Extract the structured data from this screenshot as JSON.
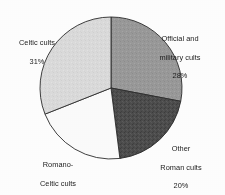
{
  "figure": {
    "background_color": "#ffffff",
    "outline_color": "#2b2b2b"
  },
  "chart_data": {
    "type": "pie",
    "title": "",
    "subtitle": "",
    "xlabel": "",
    "ylabel": "",
    "legend_position": "none",
    "grid": false,
    "start_angle_deg": 0,
    "direction": "clockwise",
    "center": {
      "x": 111,
      "y": 88
    },
    "radius": 71,
    "categories": [
      "Official and military cults",
      "Other Roman cults",
      "Romano-Celtic cults",
      "Celtic cults"
    ],
    "values": [
      28,
      20,
      21,
      31
    ],
    "value_suffix": "%",
    "colors": [
      "#9a9a9a",
      "#4d4d4d",
      "#fcfcfc",
      "#dcdcdc"
    ],
    "slices": [
      {
        "label": "Official and military cults",
        "label_line1": "Official and",
        "label_line2": "military cults",
        "value": 28,
        "value_text": "28%",
        "color": "#9a9a9a",
        "start_deg": 0,
        "end_deg": 100.8
      },
      {
        "label": "Other Roman cults",
        "label_line1": "Other",
        "label_line2": "Roman cults",
        "value": 20,
        "value_text": "20%",
        "color": "#4d4d4d",
        "start_deg": 100.8,
        "end_deg": 172.8
      },
      {
        "label": "Romano-Celtic cults",
        "label_line1": "Romano-",
        "label_line2": "Celtic cults",
        "value": 21,
        "value_text": "21%",
        "color": "#fcfcfc",
        "start_deg": 172.8,
        "end_deg": 248.4
      },
      {
        "label": "Celtic cults",
        "label_line1": "Celtic cults",
        "label_line2": "",
        "value": 31,
        "value_text": "31%",
        "color": "#dcdcdc",
        "start_deg": 248.4,
        "end_deg": 360
      }
    ]
  }
}
